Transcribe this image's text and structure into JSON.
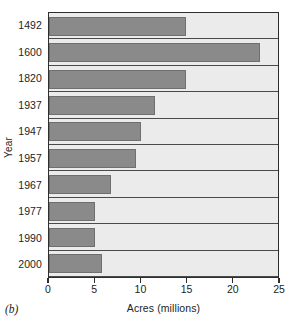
{
  "figure": {
    "panel_caption": "(b)"
  },
  "chart_data": {
    "type": "bar",
    "orientation": "horizontal",
    "title": "",
    "xlabel": "Acres (millions)",
    "ylabel": "Year",
    "categories": [
      "1492",
      "1600",
      "1820",
      "1937",
      "1947",
      "1957",
      "1967",
      "1977",
      "1990",
      "2000"
    ],
    "values": [
      15,
      23,
      15,
      11.6,
      10,
      9.5,
      6.8,
      5,
      5,
      5.8
    ],
    "xlim": [
      0,
      25
    ],
    "xticks": [
      "0",
      "5",
      "10",
      "15",
      "20",
      "25"
    ],
    "xtick_values": [
      0,
      5,
      10,
      15,
      20,
      25
    ],
    "grid": "horizontal-rules-only",
    "legend": "none",
    "colors": {
      "bar_fill": "#8a8a8a",
      "bar_edge": "#6f6f6f",
      "plot_background": "#ebebeb",
      "axis_line": "#2e2e2e",
      "gridline": "#4a4a4a",
      "page_background": "#ffffff",
      "text": "#1d1d1d"
    }
  }
}
